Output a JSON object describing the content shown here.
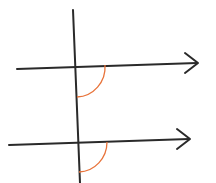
{
  "diagram": {
    "colors": {
      "line": "#2a2a2a",
      "angle_arc": "#e8733a",
      "background": "#ffffff"
    },
    "transversal": {
      "x1": 73,
      "y1": 10,
      "x2": 80,
      "y2": 183
    },
    "lines": [
      {
        "name": "upper-parallel",
        "x1": 17,
        "y1": 69,
        "x2": 198,
        "y2": 63,
        "arrow": true
      },
      {
        "name": "lower-parallel",
        "x1": 9,
        "y1": 145,
        "x2": 190,
        "y2": 139,
        "arrow": true
      }
    ],
    "angles": [
      {
        "name": "upper-angle",
        "start": [
          105,
          65
        ],
        "end": [
          77,
          97
        ],
        "r": 29
      },
      {
        "name": "lower-angle",
        "start": [
          107,
          142
        ],
        "end": [
          79,
          172
        ],
        "r": 29
      }
    ]
  }
}
